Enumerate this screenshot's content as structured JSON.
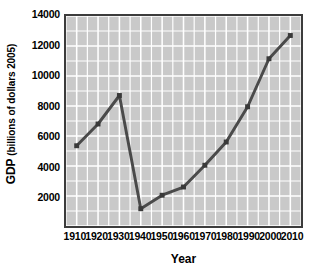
{
  "chart_data": {
    "type": "line",
    "title": "",
    "xlabel": "Year",
    "ylabel": "GDP (billions of dollars 2005)",
    "ylabel_parts": {
      "bold_prefix": "GDP",
      "suffix": "(billions of dollars 2005)"
    },
    "categories": [
      1910,
      1920,
      1930,
      1940,
      1950,
      1960,
      1970,
      1980,
      1990,
      2000,
      2010
    ],
    "x": [
      1910,
      1920,
      1930,
      1940,
      1950,
      1960,
      1970,
      1980,
      1990,
      2000,
      2010
    ],
    "values": [
      5350,
      6800,
      8700,
      1150,
      2050,
      2600,
      4050,
      5600,
      7950,
      11150,
      12700
    ],
    "series": [
      {
        "name": "GDP",
        "values": [
          5350,
          6800,
          8700,
          1150,
          2050,
          2600,
          4050,
          5600,
          7950,
          11150,
          12700
        ]
      }
    ],
    "xlim": [
      1905,
      2015
    ],
    "ylim": [
      0,
      14000
    ],
    "xticks": [
      1910,
      1920,
      1930,
      1940,
      1950,
      1960,
      1970,
      1980,
      1990,
      2000,
      2010
    ],
    "xtick_labels": [
      "1910",
      "1920",
      "1930",
      "1940",
      "1950",
      "1960",
      "1970",
      "1980",
      "1990",
      "2000",
      "2010"
    ],
    "yticks": [
      2000,
      4000,
      6000,
      8000,
      10000,
      12000,
      14000
    ],
    "ytick_labels": [
      "2000",
      "4000",
      "6000",
      "8000",
      "10000",
      "12000",
      "14000"
    ],
    "grid": true,
    "grid_x_step": 5,
    "grid_y_step": 1000,
    "legend": false,
    "legend_position": "none",
    "plot_background_color": "#c9c9c9",
    "grid_color": "#ffffff",
    "line_color": "#4a4a4a",
    "marker": "square",
    "marker_color": "#3a3a3a",
    "axis_color": "#3c3c3c",
    "text_color": "#000000"
  }
}
